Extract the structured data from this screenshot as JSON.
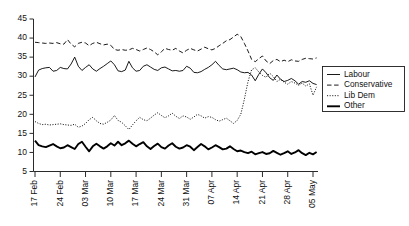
{
  "chart_data": {
    "type": "line",
    "title": "",
    "subtitle": "",
    "xlabel": "",
    "ylabel": "",
    "grid": false,
    "ylim": [
      5,
      45
    ],
    "yticks": [
      5,
      10,
      15,
      20,
      25,
      30,
      35,
      40,
      45
    ],
    "ytick_labels": [
      "5",
      "10",
      "15",
      "20",
      "25",
      "30",
      "35",
      "40",
      "45"
    ],
    "xtick_labels": [
      "17 Feb",
      "24 Feb",
      "03 Mar",
      "10 Mar",
      "17 Mar",
      "24 Mar",
      "31 Mar",
      "07 Apr",
      "14 Apr",
      "21 Apr",
      "28 Apr",
      "05 May"
    ],
    "xtick_days": [
      0,
      7,
      14,
      21,
      28,
      35,
      42,
      49,
      56,
      63,
      70,
      77
    ],
    "x_range_days": [
      0,
      78
    ],
    "legend_position": "right",
    "legend_entries": [
      "Labour",
      "Conservative",
      "Lib Dem",
      "Other"
    ],
    "series": [
      {
        "name": "Labour",
        "style": "solid",
        "linewidth": "thin",
        "color": "#000000",
        "values": [
          29.8,
          31.6,
          32.0,
          32.2,
          32.3,
          31.3,
          31.5,
          32.3,
          32.0,
          31.9,
          33.2,
          35.0,
          32.6,
          31.5,
          32.3,
          33.0,
          31.9,
          31.3,
          32.0,
          32.6,
          33.3,
          34.0,
          33.0,
          31.4,
          31.2,
          31.6,
          33.9,
          32.2,
          31.3,
          31.5,
          32.6,
          33.0,
          32.4,
          31.8,
          31.5,
          32.2,
          32.4,
          31.9,
          31.4,
          31.5,
          31.3,
          31.5,
          32.6,
          32.1,
          31.0,
          30.9,
          31.2,
          31.8,
          32.3,
          33.0,
          33.9,
          32.8,
          31.9,
          31.7,
          31.9,
          32.1,
          31.7,
          31.1,
          30.9,
          31.0,
          30.3,
          28.8,
          30.5,
          31.9,
          30.9,
          29.6,
          28.9,
          30.3,
          29.2,
          28.6,
          28.9,
          29.4,
          28.8,
          27.9,
          28.6,
          28.4,
          28.8,
          28.1,
          27.8
        ]
      },
      {
        "name": "Conservative",
        "style": "dashed",
        "linewidth": "thin",
        "color": "#000000",
        "values": [
          38.9,
          38.8,
          38.7,
          38.6,
          38.7,
          38.6,
          38.8,
          38.5,
          38.4,
          39.6,
          38.4,
          37.7,
          38.6,
          38.9,
          38.7,
          38.0,
          38.6,
          38.9,
          38.5,
          38.2,
          38.4,
          38.1,
          37.0,
          36.8,
          37.0,
          36.8,
          36.9,
          37.3,
          37.0,
          36.6,
          37.0,
          37.4,
          37.0,
          36.4,
          35.6,
          36.4,
          37.3,
          37.0,
          36.8,
          37.3,
          36.6,
          36.1,
          36.8,
          37.3,
          36.9,
          36.6,
          37.1,
          37.6,
          37.2,
          36.9,
          37.3,
          38.0,
          38.6,
          39.3,
          39.6,
          40.3,
          41.0,
          40.4,
          38.6,
          36.6,
          34.4,
          33.8,
          34.6,
          35.3,
          34.0,
          33.3,
          34.1,
          34.4,
          33.8,
          34.2,
          33.8,
          34.3,
          34.0,
          33.9,
          34.4,
          34.7,
          34.6,
          34.5,
          34.8
        ]
      },
      {
        "name": "Lib Dem",
        "style": "dotted",
        "linewidth": "thin",
        "color": "#000000",
        "values": [
          18.1,
          17.6,
          17.3,
          17.4,
          17.2,
          17.3,
          17.4,
          17.5,
          17.3,
          17.2,
          17.1,
          17.4,
          16.6,
          16.9,
          17.6,
          18.6,
          19.2,
          18.3,
          17.6,
          17.4,
          17.9,
          18.5,
          19.7,
          18.4,
          17.9,
          17.0,
          16.0,
          17.2,
          18.3,
          19.2,
          18.6,
          18.3,
          19.0,
          19.8,
          20.4,
          19.7,
          19.1,
          19.6,
          20.3,
          19.5,
          18.9,
          19.6,
          19.3,
          18.7,
          19.3,
          20.0,
          19.6,
          19.0,
          19.4,
          19.2,
          18.6,
          18.2,
          18.6,
          19.0,
          18.3,
          17.6,
          18.4,
          20.0,
          24.0,
          28.6,
          31.7,
          32.2,
          31.1,
          30.2,
          29.7,
          30.8,
          29.9,
          28.6,
          29.2,
          28.4,
          27.9,
          28.6,
          28.2,
          27.6,
          28.2,
          27.4,
          28.0,
          25.0,
          27.2
        ]
      },
      {
        "name": "Other",
        "style": "solid",
        "linewidth": "thick",
        "color": "#000000",
        "values": [
          13.1,
          11.9,
          11.6,
          11.4,
          11.8,
          12.2,
          11.6,
          11.1,
          11.3,
          11.9,
          11.4,
          10.9,
          12.2,
          12.8,
          11.5,
          10.3,
          11.6,
          12.3,
          11.6,
          11.0,
          11.6,
          12.4,
          11.8,
          12.8,
          11.9,
          12.4,
          13.1,
          12.3,
          11.6,
          12.2,
          12.7,
          11.6,
          10.9,
          11.7,
          12.3,
          11.4,
          11.0,
          11.8,
          12.4,
          11.5,
          11.0,
          11.3,
          11.9,
          11.5,
          10.6,
          11.4,
          12.2,
          11.6,
          10.8,
          11.3,
          11.9,
          11.4,
          10.8,
          11.0,
          11.6,
          10.9,
          10.3,
          10.5,
          10.1,
          9.8,
          10.2,
          9.5,
          9.8,
          10.1,
          9.6,
          9.8,
          10.4,
          9.9,
          9.4,
          9.8,
          10.3,
          9.6,
          10.0,
          10.6,
          9.8,
          9.3,
          9.9,
          9.5,
          10.1
        ]
      }
    ]
  },
  "legend": {
    "items": [
      {
        "label": "Labour",
        "style": "solid-thin"
      },
      {
        "label": "Conservative",
        "style": "dashed"
      },
      {
        "label": "Lib Dem",
        "style": "dotted"
      },
      {
        "label": "Other",
        "style": "solid-thick"
      }
    ]
  }
}
